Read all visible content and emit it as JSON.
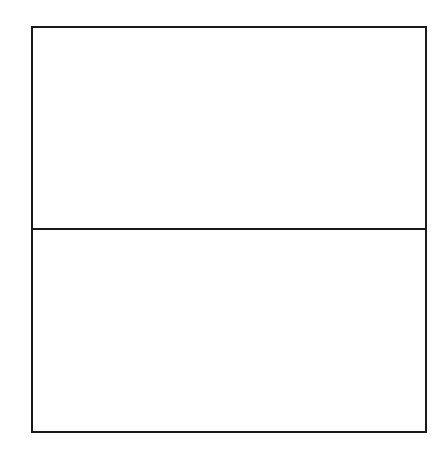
{
  "diagram": {
    "type": "divided-rectangle",
    "sections": [
      {
        "id": "top",
        "label": ""
      },
      {
        "id": "bottom",
        "label": ""
      }
    ],
    "stroke_color": "#1a1a1a",
    "background": "#ffffff"
  }
}
